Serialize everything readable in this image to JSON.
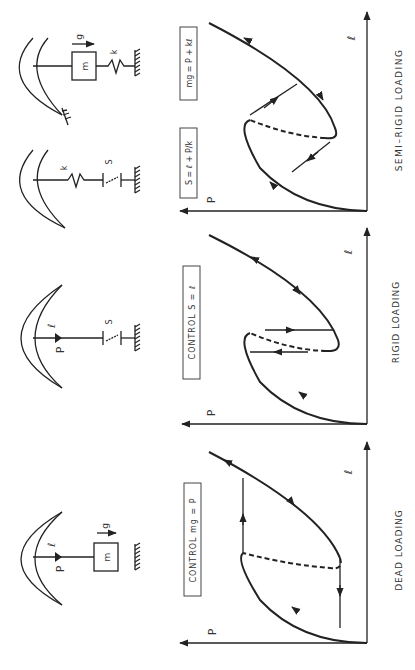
{
  "figure": {
    "orientation": "rotated-90-ccw",
    "panels": [
      {
        "id": "dead",
        "caption": "DEAD LOADING",
        "control_label": "CONTROL   mg = P",
        "axis_x": "ℓ",
        "axis_y": "P",
        "schematic": {
          "load": "P",
          "deflection": "ℓ",
          "mass": "m",
          "gravity": "g"
        }
      },
      {
        "id": "rigid",
        "caption": "RIGID LOADING",
        "control_label": "CONTROL   S = ℓ",
        "axis_x": "ℓ",
        "axis_y": "P",
        "schematic": {
          "load": "P",
          "deflection": "ℓ",
          "displacement": "S"
        }
      },
      {
        "id": "semi-rigid",
        "caption": "SEMI–RIGID LOADING",
        "control_label_1": "S = ℓ + P/k",
        "control_label_2": "mg = P + kℓ",
        "axis_x": "ℓ",
        "axis_y": "P",
        "schematic_1": {
          "spring": "k",
          "displacement": "S"
        },
        "schematic_2": {
          "mass": "m",
          "gravity": "g",
          "spring": "k"
        }
      }
    ]
  }
}
